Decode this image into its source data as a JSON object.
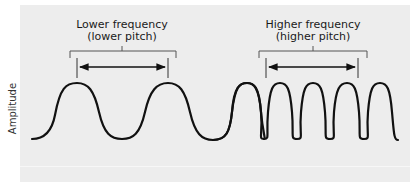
{
  "diagram": {
    "y_axis_label": "Amplitude",
    "sections": [
      {
        "title": "Lower frequency",
        "subtitle": "(lower pitch)",
        "peak_count": 2
      },
      {
        "title": "Higher frequency",
        "subtitle": "(higher pitch)",
        "peak_count": 5
      }
    ],
    "colors": {
      "background": "#ededed",
      "wave": "#111111",
      "bracket": "#555555",
      "arrow": "#111111"
    }
  }
}
